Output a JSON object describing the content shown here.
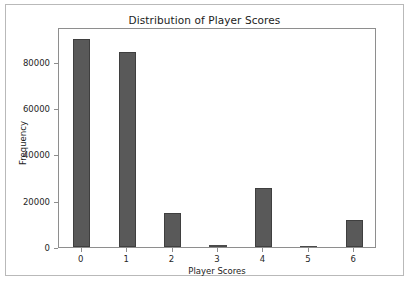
{
  "figure": {
    "background_color": "#ffffff",
    "border_color": "#b9b9b9"
  },
  "chart_data": {
    "type": "bar",
    "title": "Distribution of Player Scores",
    "xlabel": "Player Scores",
    "ylabel": "Frequency",
    "categories": [
      "0",
      "1",
      "2",
      "3",
      "4",
      "5",
      "6"
    ],
    "values": [
      90000,
      84000,
      14800,
      1000,
      25500,
      400,
      11500
    ],
    "series": [
      {
        "name": "Frequency",
        "values": [
          90000,
          84000,
          14800,
          1000,
          25500,
          400,
          11500
        ]
      }
    ],
    "xlim": [
      -0.5,
      6.5
    ],
    "ylim": [
      0,
      95000
    ],
    "ytick_labels": [
      "0",
      "20000",
      "40000",
      "60000",
      "80000"
    ],
    "ytick_values": [
      0,
      20000,
      40000,
      60000,
      80000
    ],
    "xtick_labels": [
      "0",
      "1",
      "2",
      "3",
      "4",
      "5",
      "6"
    ],
    "grid": false,
    "legend": null,
    "bar_color": "#595959",
    "bar_edge_color": "#3f3f3f",
    "axis_color": "#8e8e8e",
    "text_color": "#1b1b1b"
  }
}
